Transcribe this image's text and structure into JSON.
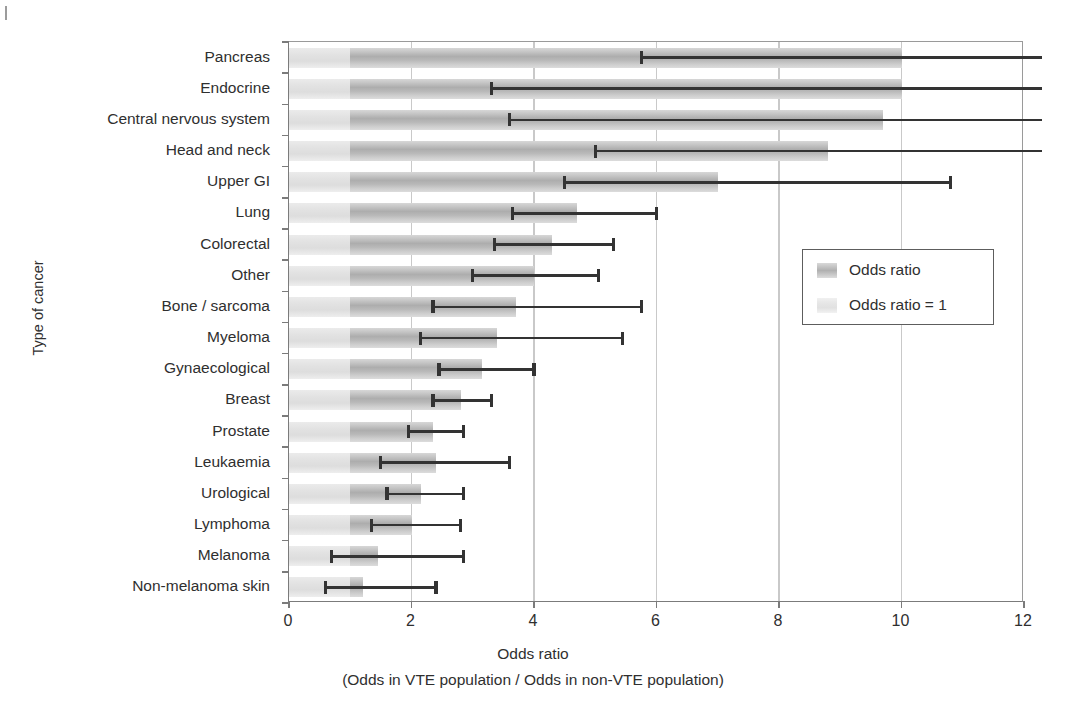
{
  "chart_data": {
    "type": "bar",
    "orientation": "horizontal",
    "title": "",
    "xlabel": "Odds ratio",
    "xlabel_sub": "(Odds in VTE population / Odds in non-VTE population)",
    "ylabel": "Type of cancer",
    "xlim": [
      0,
      12
    ],
    "xticks": [
      0,
      2,
      4,
      6,
      8,
      10,
      12
    ],
    "xtick_labels": [
      "0",
      "2",
      "4",
      "6",
      "8",
      "10",
      "12"
    ],
    "grid": "vertical",
    "reference_line": 1,
    "categories": [
      "Pancreas",
      "Endocrine",
      "Central nervous system",
      "Head and neck",
      "Upper GI",
      "Lung",
      "Colorectal",
      "Other",
      "Bone / sarcoma",
      "Myeloma",
      "Gynaecological",
      "Breast",
      "Prostate",
      "Leukaemia",
      "Urological",
      "Lymphoma",
      "Melanoma",
      "Non-melanoma skin"
    ],
    "values": [
      10.0,
      10.0,
      9.7,
      8.8,
      7.0,
      4.7,
      4.3,
      4.0,
      3.7,
      3.4,
      3.15,
      2.8,
      2.35,
      2.4,
      2.15,
      2.0,
      1.45,
      1.2
    ],
    "ci_lower": [
      5.75,
      3.3,
      3.6,
      5.0,
      4.5,
      3.65,
      3.35,
      3.0,
      2.35,
      2.15,
      2.45,
      2.35,
      1.95,
      1.5,
      1.6,
      1.35,
      0.7,
      0.6
    ],
    "ci_upper": [
      12.3,
      12.3,
      12.3,
      12.3,
      10.8,
      6.0,
      5.3,
      5.05,
      5.75,
      5.45,
      4.0,
      3.3,
      2.85,
      3.6,
      2.85,
      2.8,
      2.85,
      2.4
    ],
    "ci_upper_clipped": [
      true,
      true,
      true,
      true,
      false,
      false,
      false,
      false,
      false,
      false,
      false,
      false,
      false,
      false,
      false,
      false,
      false,
      false
    ],
    "legend": {
      "position": "right",
      "entries": [
        {
          "label": "Odds ratio",
          "swatch": "odds-ratio"
        },
        {
          "label": "Odds ratio = 1",
          "swatch": "odds-ratio-one"
        }
      ]
    },
    "colors": {
      "bar": "#bdbdbd",
      "bar_reference": "#e6e6e6",
      "error_bar": "#333333",
      "gridline": "#c9c9c9",
      "axis": "#7b7b7b",
      "text": "#2f2f2f"
    }
  }
}
